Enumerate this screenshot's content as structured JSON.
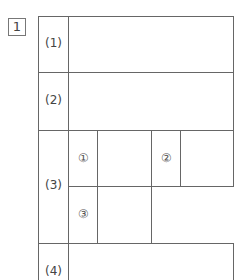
{
  "question_number": "1",
  "rows": [
    {
      "label": "(1)"
    },
    {
      "label": "(2)"
    },
    {
      "label": "(3)",
      "subparts": [
        "①",
        "②",
        "③"
      ]
    },
    {
      "label": "(4)"
    }
  ]
}
